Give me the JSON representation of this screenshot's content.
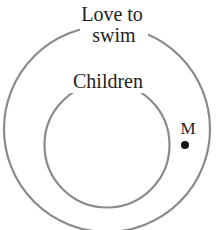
{
  "diagram": {
    "type": "venn",
    "outer_set": {
      "label_line1": "Love to",
      "label_line2": "swim"
    },
    "inner_set": {
      "label": "Children"
    },
    "point": {
      "label": "M",
      "location": "inside Love to swim, outside Children"
    },
    "colors": {
      "circle": "#8a8a8a",
      "text": "#222222",
      "point": "#111111"
    }
  }
}
